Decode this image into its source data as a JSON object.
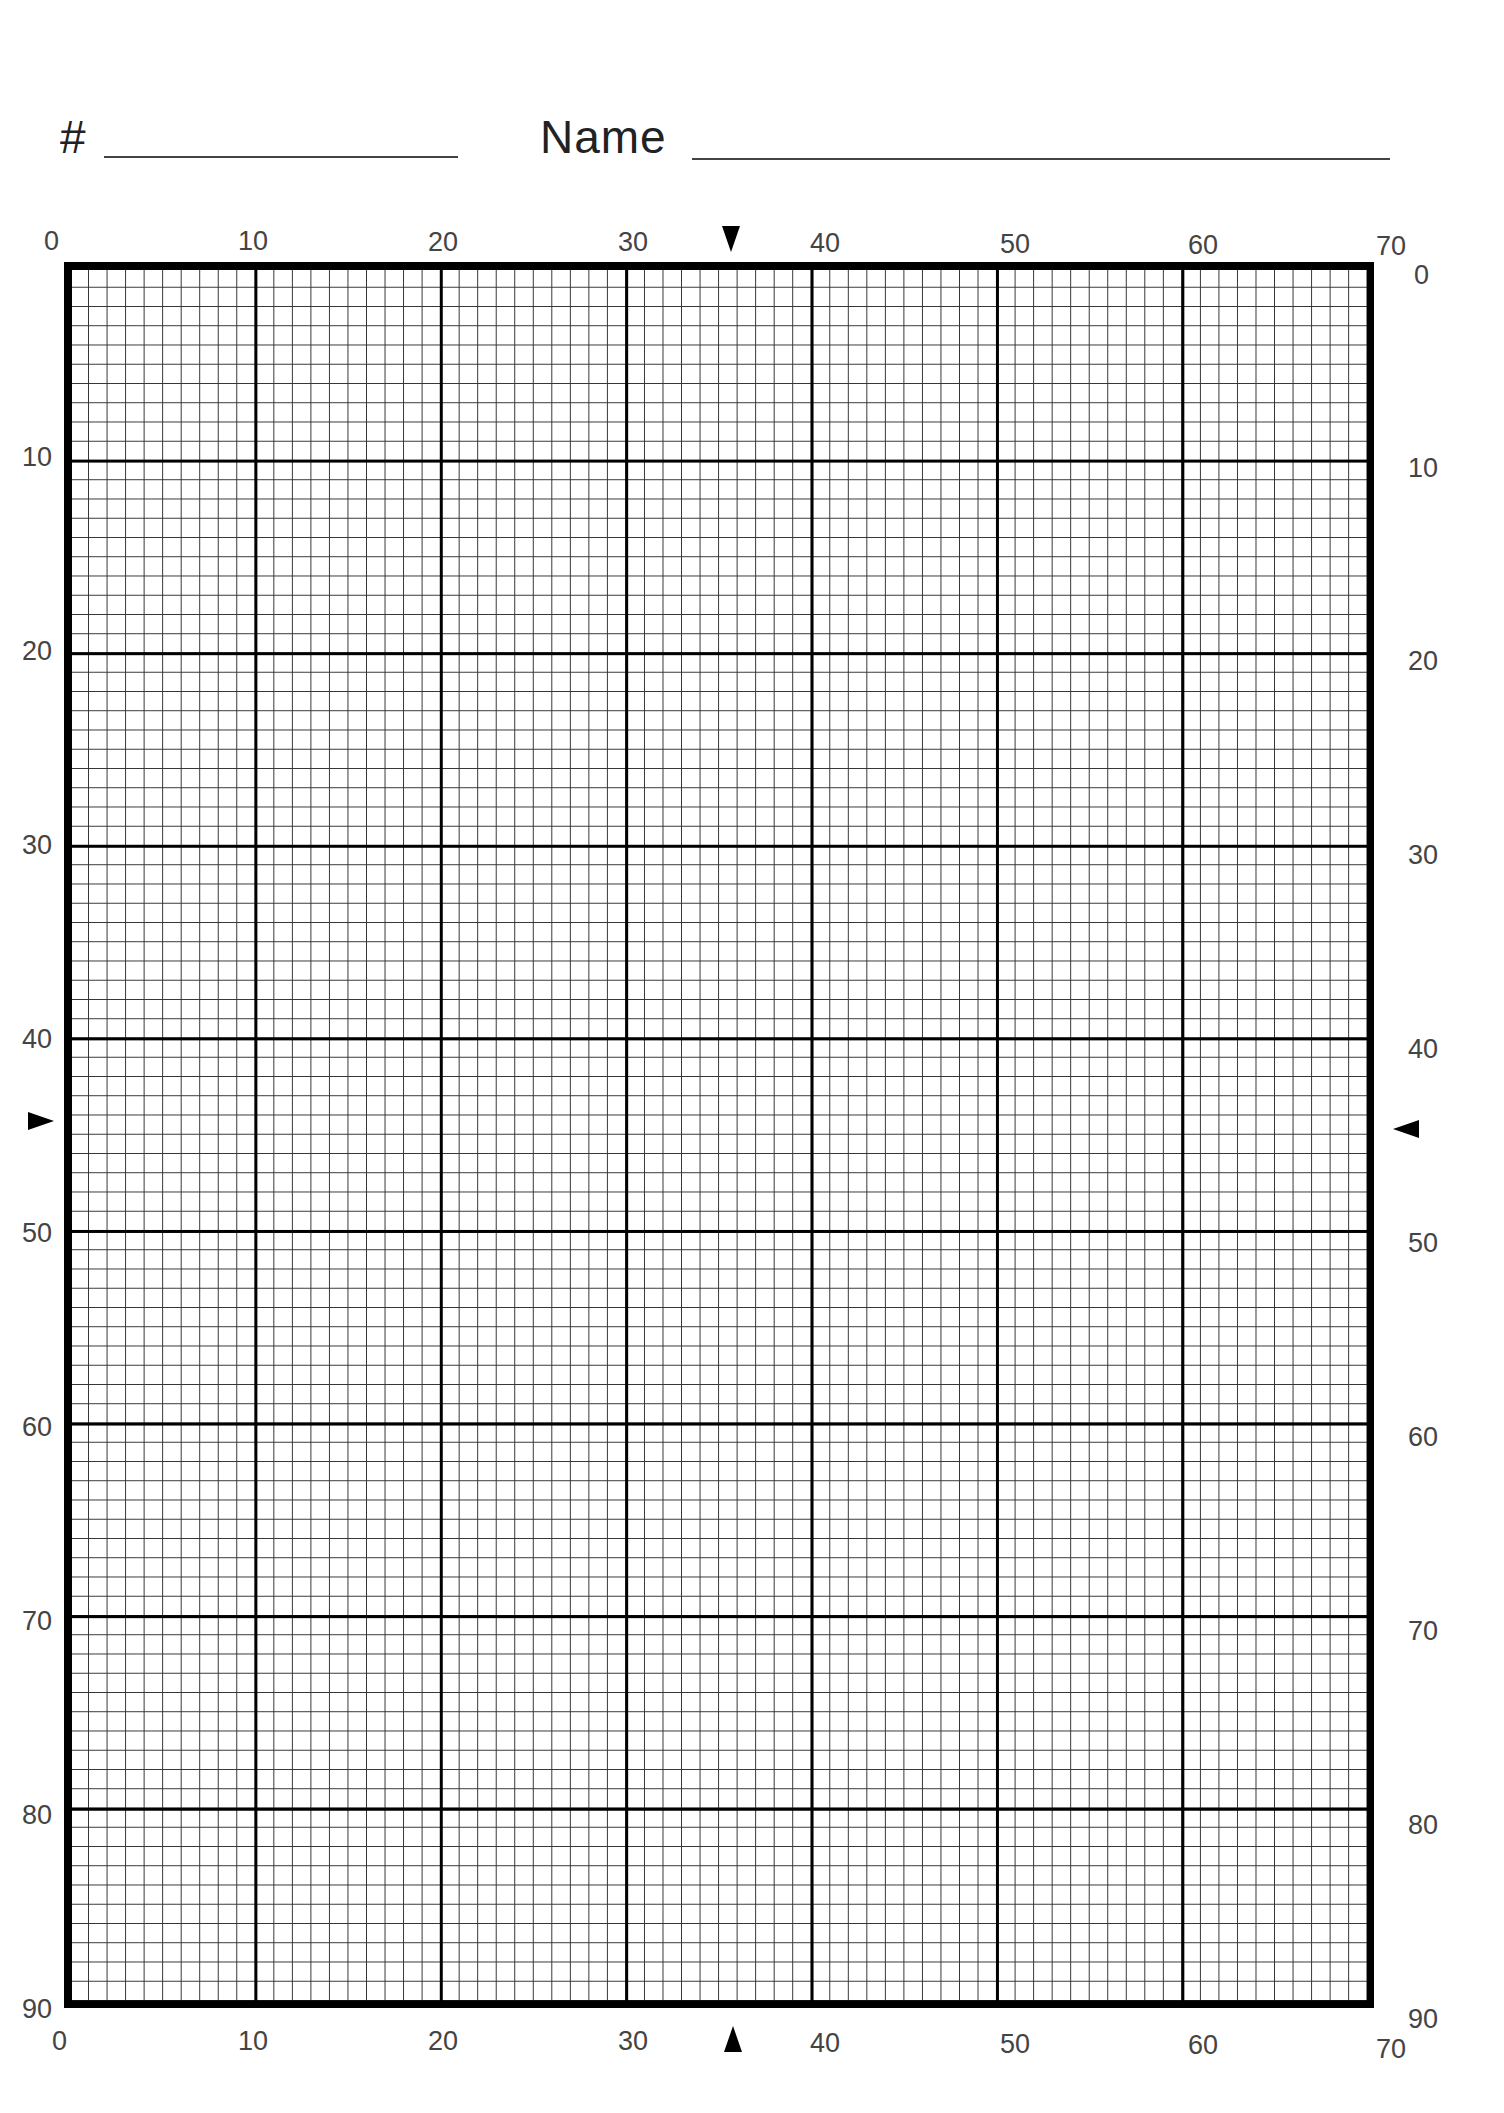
{
  "header": {
    "number_label": "#",
    "name_label": "Name"
  },
  "grid": {
    "columns": 70,
    "rows": 90,
    "major_every": 10,
    "line_color": "#000000",
    "background": "#ffffff"
  },
  "axes": {
    "top": [
      "0",
      "10",
      "20",
      "30",
      "40",
      "50",
      "60",
      "70"
    ],
    "bottom": [
      "0",
      "10",
      "20",
      "30",
      "40",
      "50",
      "60",
      "70"
    ],
    "left": [
      "10",
      "20",
      "30",
      "40",
      "50",
      "60",
      "70",
      "80",
      "90"
    ],
    "right": [
      "0",
      "10",
      "20",
      "30",
      "40",
      "50",
      "60",
      "70",
      "80",
      "90"
    ]
  },
  "center_markers": {
    "top": "triangle-down",
    "bottom": "triangle-up",
    "left": "triangle-right",
    "right": "triangle-left",
    "column": 35,
    "row": 45
  }
}
